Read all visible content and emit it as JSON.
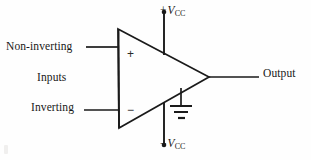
{
  "figure": {
    "kind": "operational-amplifier-schematic",
    "background_color": "#fefefe",
    "line_color": "#1a1a1a",
    "text_color": "#181818"
  },
  "labels": {
    "non_inverting": "Non-inverting",
    "inputs": "Inputs",
    "inverting": "Inverting",
    "output": "Output",
    "supply_positive_sign": "+",
    "supply_negative_sign": "−",
    "supply_symbol": "V",
    "supply_subscript": "CC",
    "terminal_plus": "+",
    "terminal_minus": "−"
  },
  "geometry": {
    "triangle": {
      "top_left_x": 118,
      "top_left_y": 29,
      "bottom_left_x": 119,
      "bottom_left_y": 128,
      "apex_x": 209,
      "apex_y": 77
    },
    "non_inverting_wire_y": 47,
    "inverting_wire_y": 110,
    "output_wire_y": 77,
    "supply_line_x": 164,
    "ground_x": 181
  }
}
